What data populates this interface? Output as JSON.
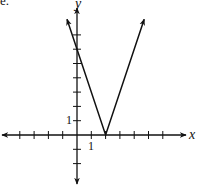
{
  "corner_label": "e.",
  "chart_data": {
    "type": "line",
    "title": "",
    "function": "y = |3x - 6|",
    "xlabel": "x",
    "ylabel": "y",
    "series": [
      {
        "name": "V-shaped graph",
        "x": [
          -0.7,
          2,
          4.7
        ],
        "y": [
          8.1,
          0,
          8.1
        ]
      }
    ],
    "vertex": [
      2,
      0
    ],
    "y_intercept": 6,
    "tick_labels": {
      "x": "1",
      "y": "1"
    },
    "xlim": [
      -5.5,
      7.8
    ],
    "ylim": [
      -3.5,
      9
    ],
    "grid": false,
    "arrows": true
  },
  "axes": {
    "x_label": "x",
    "y_label": "y",
    "x_tick_label": "1",
    "y_tick_label": "1"
  },
  "colors": {
    "line": "#111111",
    "background": "#ffffff"
  }
}
